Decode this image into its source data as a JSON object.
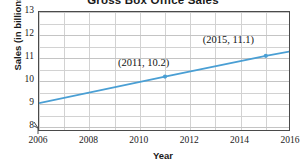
{
  "chart_data": {
    "type": "line",
    "title": "Gross Box Office Sales",
    "xlabel": "Year",
    "ylabel": "Sales (in billions)",
    "xlim": [
      2006,
      2016
    ],
    "ylim": [
      7.8,
      13
    ],
    "grid": true,
    "legend": "none",
    "y_axis_break": true,
    "x_ticks": [
      "2006",
      "2008",
      "2010",
      "2012",
      "2014",
      "2016"
    ],
    "x_tick_values": [
      2006,
      2008,
      2010,
      2012,
      2014,
      2016
    ],
    "y_ticks": [
      "8",
      "9",
      "10",
      "11",
      "12",
      "13"
    ],
    "y_tick_values": [
      8,
      9,
      10,
      11,
      12,
      13
    ],
    "x": [
      2006,
      2011,
      2015,
      2016
    ],
    "values": [
      9.05,
      10.2,
      11.1,
      11.3
    ],
    "series": [
      {
        "name": "Gross Box Office Sales",
        "color": "#4a9fd4",
        "x": [
          2006,
          2011,
          2015,
          2016
        ],
        "values": [
          9.05,
          10.2,
          11.1,
          11.3
        ]
      }
    ],
    "markers": [
      {
        "x": 2011,
        "y": 10.2
      },
      {
        "x": 2015,
        "y": 11.1
      },
      {
        "x": 2016,
        "y": 11.3
      }
    ],
    "annotations": [
      {
        "text": "(2011, 10.2)",
        "x": 2011,
        "y": 10.2
      },
      {
        "text": "(2015, 11.1)",
        "x": 2015,
        "y": 11.1
      }
    ]
  },
  "colors": {
    "series": "#4a9fd4",
    "grid": "#d2d2d2",
    "frame": "#4a4a4a",
    "text": "#1a1a1a",
    "background": "#ffffff"
  }
}
